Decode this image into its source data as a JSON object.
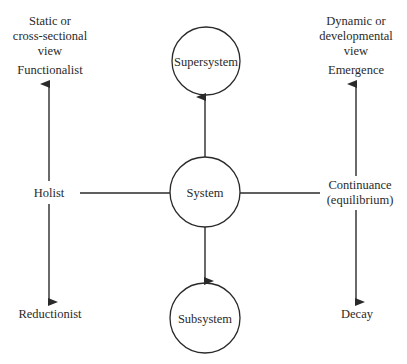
{
  "diagram": {
    "left_axis": {
      "header_lines": [
        "Static or",
        "cross-sectional",
        "view"
      ],
      "top_label": "Functionalist",
      "middle_label": "Holist",
      "bottom_label": "Reductionist"
    },
    "right_axis": {
      "header_lines": [
        "Dynamic or",
        "developmental",
        "view"
      ],
      "top_label": "Emergence",
      "middle_label_lines": [
        "Continuance",
        "(equilibrium)"
      ],
      "bottom_label": "Decay"
    },
    "nodes": {
      "supersystem": "Supersystem",
      "system": "System",
      "subsystem": "Subsystem"
    },
    "connections": [
      {
        "from": "System",
        "to": "Supersystem",
        "type": "arrow"
      },
      {
        "from": "System",
        "to": "Subsystem",
        "type": "arrow"
      },
      {
        "from": "System",
        "to": "Holist",
        "type": "line"
      },
      {
        "from": "System",
        "to": "Continuance (equilibrium)",
        "type": "line"
      },
      {
        "from": "Holist",
        "to": "Functionalist",
        "type": "arrow"
      },
      {
        "from": "Holist",
        "to": "Reductionist",
        "type": "arrow"
      },
      {
        "from": "Continuance (equilibrium)",
        "to": "Emergence",
        "type": "arrow"
      },
      {
        "from": "Continuance (equilibrium)",
        "to": "Decay",
        "type": "arrow"
      }
    ],
    "colors": {
      "stroke": "#2a2a2a",
      "text": "#2a2a2a",
      "background": "#ffffff"
    }
  }
}
